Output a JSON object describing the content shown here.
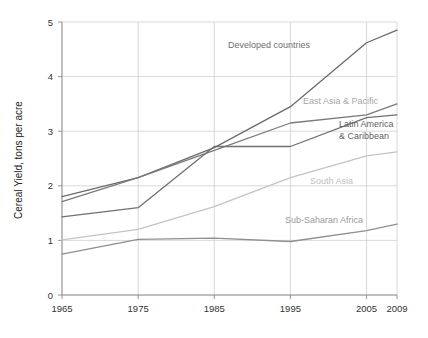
{
  "chart_data": {
    "type": "line",
    "title": "",
    "subtitle": "",
    "xlabel": "",
    "ylabel": "Cereal Yield, tons per acre",
    "x": [
      1965,
      1975,
      1985,
      1995,
      2005,
      2009
    ],
    "xtick_labels": [
      "1965",
      "1975",
      "1985",
      "1995",
      "2005",
      "2009"
    ],
    "ytick_labels": [
      "0",
      "1",
      "2",
      "3",
      "4",
      "5"
    ],
    "yticks": [
      0,
      1,
      2,
      3,
      4,
      5
    ],
    "xlim": [
      1965,
      2009
    ],
    "ylim": [
      0,
      5
    ],
    "grid": "horizontal-and-vertical",
    "legend_position": "inline-annotations",
    "series": [
      {
        "name": "Developed countries",
        "values": [
          1.8,
          2.15,
          2.7,
          3.45,
          4.62,
          4.85
        ],
        "color": "#6b6b6b",
        "label": "Developed countries",
        "label_color": "#6f6f6f",
        "label_x": 228,
        "label_y": 48,
        "label_anchor": "start"
      },
      {
        "name": "East Asia & Pacific",
        "values": [
          1.71,
          2.15,
          2.65,
          3.15,
          3.3,
          3.5
        ],
        "color": "#7a7a7a",
        "label": "East Asia & Pacific",
        "label_color": "#a8a8a8",
        "label_x": 303,
        "label_y": 104,
        "label_anchor": "start"
      },
      {
        "name": "Latin America & Caribbean",
        "values": [
          1.43,
          1.6,
          2.72,
          2.72,
          3.25,
          3.3
        ],
        "color": "#707070",
        "label": "Latin America",
        "label_2": "& Caribbean",
        "label_color": "#5f5f5f",
        "label_x": 339,
        "label_y": 127,
        "label_2_y": 139,
        "label_anchor": "start"
      },
      {
        "name": "South Asia",
        "values": [
          1.01,
          1.2,
          1.62,
          2.15,
          2.55,
          2.62
        ],
        "color": "#c4c4c4",
        "label": "South Asia",
        "label_color": "#c0c0c0",
        "label_x": 310,
        "label_y": 184,
        "label_anchor": "start"
      },
      {
        "name": "Sub-Saharan Africa",
        "values": [
          0.75,
          1.02,
          1.04,
          0.98,
          1.18,
          1.3
        ],
        "color": "#8f8f8f",
        "label": "Sub-Saharan Africa",
        "label_color": "#9a9a9a",
        "label_x": 285,
        "label_y": 223,
        "label_anchor": "start"
      }
    ]
  }
}
